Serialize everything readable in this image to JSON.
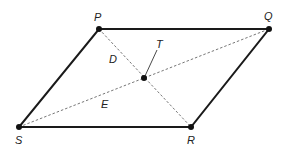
{
  "diagram": {
    "type": "parallelogram",
    "colors": {
      "stroke": "#1a1a1a",
      "dashed": "#555555",
      "label": "#222222"
    },
    "vertices": {
      "P": {
        "label": "P",
        "x": 99,
        "y": 29
      },
      "Q": {
        "label": "Q",
        "x": 269,
        "y": 29
      },
      "R": {
        "label": "R",
        "x": 191,
        "y": 127
      },
      "S": {
        "label": "S",
        "x": 19,
        "y": 127
      }
    },
    "center": {
      "x": 144,
      "y": 78
    },
    "labels": {
      "P": "P",
      "Q": "Q",
      "R": "R",
      "S": "S",
      "T": "T",
      "D": "D",
      "E": "E"
    },
    "edges": [
      "PQ",
      "QR",
      "RS",
      "SP"
    ],
    "diagonals": [
      "PR",
      "SQ"
    ]
  }
}
